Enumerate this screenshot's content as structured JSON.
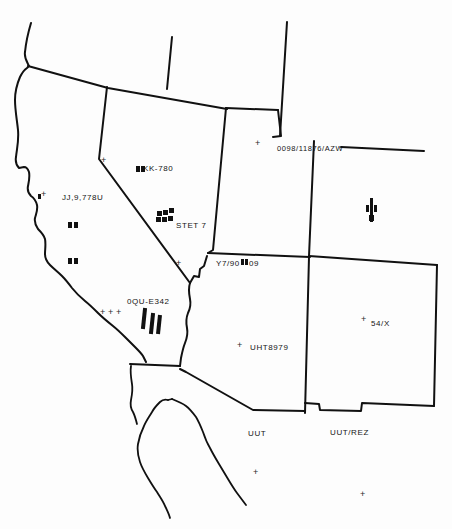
{
  "map": {
    "title": "Southwestern United States outline map with handwritten annotations",
    "background_color": "#fdfdfd",
    "ink_color": "#111111",
    "regions": [
      {
        "name": "california",
        "label": ""
      },
      {
        "name": "nevada",
        "label": ""
      },
      {
        "name": "utah",
        "label": ""
      },
      {
        "name": "arizona",
        "label": ""
      },
      {
        "name": "new-mexico",
        "label": ""
      },
      {
        "name": "colorado",
        "label": ""
      },
      {
        "name": "baja-california",
        "label": ""
      }
    ],
    "annotations": [
      {
        "id": "nevada-code",
        "text": "KK-780",
        "x": 143,
        "y": 166
      },
      {
        "id": "california-code",
        "text": "JJ,9,778U",
        "x": 65,
        "y": 196
      },
      {
        "id": "stet-code",
        "text": "STET 7",
        "x": 178,
        "y": 224
      },
      {
        "id": "colorado-code",
        "text": "0098/11876/AZW",
        "x": 276,
        "y": 146
      },
      {
        "id": "utah-south-code",
        "text": "Y7/90",
        "x": 218,
        "y": 261
      },
      {
        "id": "utah-south-code-b",
        "text": "09",
        "x": 248,
        "y": 261
      },
      {
        "id": "arizona-code",
        "text": "UHT8979",
        "x": 252,
        "y": 345
      },
      {
        "id": "newmexico-code",
        "text": "54/X",
        "x": 372,
        "y": 322
      },
      {
        "id": "socal-code",
        "text": "0QU-E342",
        "x": 128,
        "y": 299
      },
      {
        "id": "gulf-label",
        "text": "UUT",
        "x": 249,
        "y": 431
      },
      {
        "id": "gulf-rez-label",
        "text": "UUT/REZ",
        "x": 331,
        "y": 430
      }
    ],
    "crosses": [
      {
        "id": "cross-norcal",
        "x": 103,
        "y": 161
      },
      {
        "id": "cross-calwest",
        "x": 40,
        "y": 195
      },
      {
        "id": "cross-nevada-west",
        "x": 39,
        "y": 198
      },
      {
        "id": "cross-sierra",
        "x": 178,
        "y": 264
      },
      {
        "id": "cross-colorado-w",
        "x": 257,
        "y": 143
      },
      {
        "id": "cross-arizona",
        "x": 239,
        "y": 346
      },
      {
        "id": "cross-newmexico",
        "x": 363,
        "y": 320
      },
      {
        "id": "cross-socal-a",
        "x": 102,
        "y": 313
      },
      {
        "id": "cross-socal-b",
        "x": 110,
        "y": 313
      },
      {
        "id": "cross-socal-c",
        "x": 118,
        "y": 313
      },
      {
        "id": "cross-gulf-upper",
        "x": 255,
        "y": 473
      },
      {
        "id": "cross-gulf-lower",
        "x": 362,
        "y": 495
      }
    ],
    "square_marks": [
      {
        "id": "mark-cal-a",
        "x": 68,
        "y": 222,
        "w": 4,
        "h": 6
      },
      {
        "id": "mark-cal-b",
        "x": 74,
        "y": 222,
        "w": 4,
        "h": 6
      },
      {
        "id": "mark-cal-c",
        "x": 68,
        "y": 259,
        "w": 4,
        "h": 6
      },
      {
        "id": "mark-cal-d",
        "x": 74,
        "y": 259,
        "w": 4,
        "h": 6
      },
      {
        "id": "mark-nv-a",
        "x": 136,
        "y": 167,
        "w": 4,
        "h": 6
      },
      {
        "id": "mark-nv-b",
        "x": 141,
        "y": 167,
        "w": 4,
        "h": 6
      },
      {
        "id": "mark-y7-a",
        "x": 241,
        "y": 260,
        "w": 3.5,
        "h": 6
      },
      {
        "id": "mark-y7-b",
        "x": 245,
        "y": 260,
        "w": 3.5,
        "h": 6
      }
    ],
    "hatch_bars": [
      {
        "id": "bar-socal-1",
        "x": 143,
        "y": 310,
        "w": 4,
        "h": 20,
        "rot": 6
      },
      {
        "id": "bar-socal-2",
        "x": 150,
        "y": 314,
        "w": 4,
        "h": 20,
        "rot": 6
      },
      {
        "id": "bar-socal-3",
        "x": 156,
        "y": 316,
        "w": 4,
        "h": 18,
        "rot": 6
      }
    ],
    "cluster_stet": [
      {
        "id": "stet-sq-1",
        "x": 157,
        "y": 211,
        "w": 5,
        "h": 5
      },
      {
        "id": "stet-sq-2",
        "x": 163,
        "y": 211,
        "w": 5,
        "h": 5
      },
      {
        "id": "stet-sq-3",
        "x": 169,
        "y": 209,
        "w": 5,
        "h": 5
      },
      {
        "id": "stet-sq-4",
        "x": 157,
        "y": 217,
        "w": 5,
        "h": 5
      },
      {
        "id": "stet-sq-5",
        "x": 163,
        "y": 217,
        "w": 5,
        "h": 5
      },
      {
        "id": "stet-sq-6",
        "x": 169,
        "y": 217,
        "w": 5,
        "h": 5
      }
    ],
    "cluster_colorado": [
      {
        "id": "co-sq-1",
        "x": 368,
        "y": 203,
        "w": 2.5,
        "h": 7
      },
      {
        "id": "co-sq-2",
        "x": 372,
        "y": 200,
        "w": 3.5,
        "h": 22
      },
      {
        "id": "co-sq-3",
        "x": 377,
        "y": 205,
        "w": 2.5,
        "h": 7
      },
      {
        "id": "co-sq-4",
        "x": 370,
        "y": 214,
        "w": 3,
        "h": 7
      }
    ],
    "borders": {
      "stroke_width": 2.0,
      "coast_stroke_width": 1.8
    }
  }
}
